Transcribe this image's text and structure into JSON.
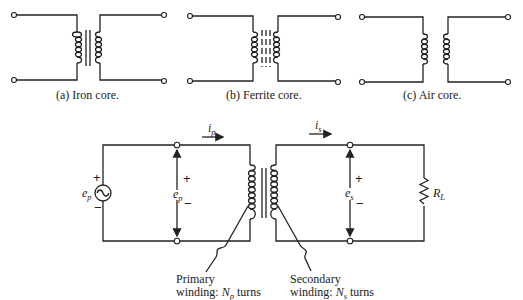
{
  "figures": {
    "a": {
      "caption": "(a)  Iron core.",
      "core": "iron"
    },
    "b": {
      "caption": "(b)  Ferrite core.",
      "core": "ferrite"
    },
    "c": {
      "caption": "(c)  Air core.",
      "core": "air"
    }
  },
  "circuit": {
    "source": {
      "label": "e",
      "sub": "p",
      "plus": "+",
      "minus": "−",
      "icon": "ac-source-icon"
    },
    "primary_current": {
      "label": "i",
      "sub": "p"
    },
    "secondary_current": {
      "label": "i",
      "sub": "s"
    },
    "primary_voltage": {
      "label": "e",
      "sub": "p",
      "plus": "+",
      "minus": "−"
    },
    "secondary_voltage": {
      "label": "e",
      "sub": "s",
      "plus": "+",
      "minus": "−"
    },
    "load": {
      "label": "R",
      "sub": "L",
      "icon": "resistor-icon"
    },
    "primary_winding": {
      "line1": "Primary",
      "line2_prefix": "winding: ",
      "symbol": "N",
      "sub": "p",
      "suffix": " turns"
    },
    "secondary_winding": {
      "line1": "Secondary",
      "line2_prefix": "winding: ",
      "symbol": "N",
      "sub": "s",
      "suffix": " turns"
    }
  }
}
